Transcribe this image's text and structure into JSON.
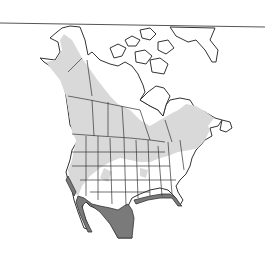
{
  "map": {
    "region": "North America",
    "type": "species range map",
    "legend_colors": {
      "breeding_range": "#d9d9d9",
      "year_round_range": "#7a7a7a",
      "land": "#ffffff",
      "border": "#333333",
      "background": "#ffffff"
    }
  }
}
